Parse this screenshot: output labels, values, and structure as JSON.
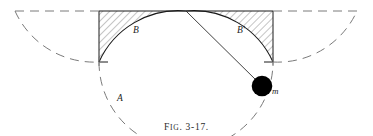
{
  "figure": {
    "caption_prefix": "F",
    "caption_small": "IG",
    "caption_rest": ". 3-17.",
    "caption_full": "FIG. 3-17.",
    "labels": {
      "left_region": "B",
      "right_region": "B'",
      "lower_arc": "A",
      "mass": "m"
    },
    "colors": {
      "stroke": "#1a1a1a",
      "dashed_stroke": "#7a7a7a",
      "hatch": "#9a9a9a",
      "ball_fill": "#000000",
      "background": "#ffffff",
      "caption": "#2b2b2b"
    },
    "geometry": {
      "rect_left": 99,
      "rect_right": 273,
      "rect_top": 11,
      "rect_bottom": 62,
      "center_x": 186,
      "arc_radius": 87,
      "ball_center_x": 262,
      "ball_center_y": 86,
      "ball_radius": 10,
      "left_dash_arc_start_x": 15,
      "right_dash_arc_end_x": 357,
      "semicircle_bottom_y": 100
    }
  }
}
